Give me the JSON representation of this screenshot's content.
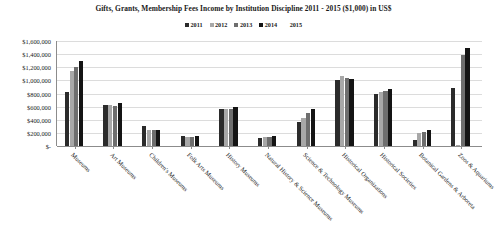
{
  "chart_data": {
    "type": "bar",
    "title": "Gifts, Grants, Membership Fees Income by Institution Discipline 2011 - 2015 ($1,000) in US$",
    "xlabel": "",
    "ylabel": "",
    "ylim": [
      0,
      1600000
    ],
    "ytick_values": [
      1600000,
      1400000,
      1200000,
      1000000,
      800000,
      600000,
      400000,
      200000,
      0
    ],
    "ytick_labels": [
      "$1,600,000",
      "$1,400,000",
      "$1,200,000",
      "$1,000,000",
      "$800,000",
      "$600,000",
      "$400,000",
      "$200,000",
      "$-"
    ],
    "grid": true,
    "legend_position": "top-center",
    "categories": [
      "Museums",
      "Art Museums",
      "Children's Museums",
      "Folk Arts Museums",
      "History Museums",
      "Natural History & Science Museums",
      "Science & Technology Museums",
      "Historical Organizations",
      "Historical Societies",
      "Botanical Gardens & Arboreta",
      "Zoos & Aquariums"
    ],
    "series": [
      {
        "name": "2011",
        "color": "#2b2b2b",
        "values": [
          820000,
          620000,
          300000,
          160000,
          560000,
          120000,
          360000,
          1000000,
          790000,
          90000,
          880000
        ]
      },
      {
        "name": "2012",
        "color": "#a8a8a8",
        "values": [
          1140000,
          630000,
          240000,
          130000,
          570000,
          130000,
          420000,
          1060000,
          830000,
          200000,
          20000
        ]
      },
      {
        "name": "2013",
        "color": "#6e6e6e",
        "values": [
          1200000,
          610000,
          240000,
          140000,
          570000,
          130000,
          500000,
          1030000,
          840000,
          210000,
          1390000
        ]
      },
      {
        "name": "2014",
        "color": "#141414",
        "values": [
          1290000,
          650000,
          240000,
          150000,
          590000,
          150000,
          570000,
          1020000,
          870000,
          250000,
          1500000
        ]
      },
      {
        "name": "2015",
        "color": "#ffffff",
        "values": [
          0,
          0,
          0,
          0,
          0,
          0,
          0,
          0,
          0,
          0,
          0
        ]
      }
    ]
  },
  "legend": {
    "items": [
      {
        "label": "2011"
      },
      {
        "label": "2012"
      },
      {
        "label": "2013"
      },
      {
        "label": "2014"
      },
      {
        "label": "2015"
      }
    ]
  }
}
